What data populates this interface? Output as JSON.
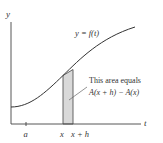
{
  "diagram": {
    "type": "area-under-curve",
    "axes": {
      "y_label": "y",
      "x_label": "t"
    },
    "curve": {
      "label": "y = f(t)"
    },
    "ticks": [
      {
        "label": "a"
      },
      {
        "label": "x"
      },
      {
        "label": "x + h"
      }
    ],
    "annotation": {
      "line1": "This area equals",
      "line2": "A(x + h) − A(x)"
    },
    "colors": {
      "axis": "#444444",
      "curve": "#333333",
      "strip_fill": "#d9d9d9",
      "strip_stroke": "#555555",
      "text": "#333333"
    }
  }
}
